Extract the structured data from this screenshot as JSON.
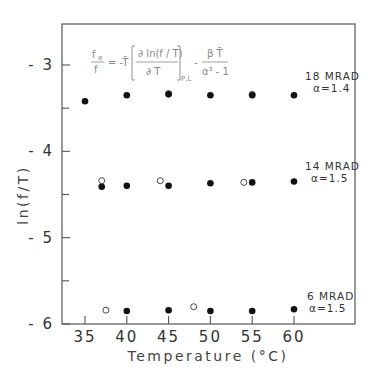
{
  "chart_data": {
    "type": "scatter",
    "title": "",
    "xlabel": "Temperature (°C)",
    "ylabel": "ln(f/T)",
    "xlim": [
      31.5,
      68.5
    ],
    "ylim": [
      -6,
      -2.3
    ],
    "x_ticks": [
      35,
      40,
      45,
      50,
      55,
      60
    ],
    "x_tick_labels": [
      "35",
      "40",
      "45",
      "50",
      "55",
      "60"
    ],
    "y_ticks": [
      -3,
      -4,
      -5,
      -6
    ],
    "y_tick_labels": [
      "-3",
      "-4",
      "-5",
      "-6"
    ],
    "y_minor_ticks": [
      -3.5,
      -4.5,
      -5.5
    ],
    "grid": false,
    "formula": {
      "lhs_num": "f",
      "lhs_num_sub": "e",
      "lhs_den": "f",
      "eq": "= -T̄",
      "frac_num": "∂ ln(f / T)",
      "frac_den": "∂ T",
      "subscript": "P,L",
      "minus": "-",
      "frac2_num": "β T̄",
      "frac2_den": "α³ - 1"
    },
    "series": [
      {
        "name": "18 MRAD",
        "label_line1": "18 MRAD",
        "label_line2": "α=1.4",
        "filled": [
          {
            "x": 35,
            "y": -3.42
          },
          {
            "x": 40,
            "y": -3.35
          },
          {
            "x": 45,
            "y": -3.34
          },
          {
            "x": 50,
            "y": -3.35
          },
          {
            "x": 55,
            "y": -3.35
          },
          {
            "x": 60,
            "y": -3.35
          }
        ],
        "open": [
          {
            "x": 45,
            "y": -3.33
          },
          {
            "x": 55,
            "y": -3.34
          }
        ]
      },
      {
        "name": "14 MRAD",
        "label_line1": "14 MRAD",
        "label_line2": "α=1.5",
        "filled": [
          {
            "x": 37,
            "y": -4.41
          },
          {
            "x": 40,
            "y": -4.4
          },
          {
            "x": 45,
            "y": -4.4
          },
          {
            "x": 50,
            "y": -4.37
          },
          {
            "x": 55,
            "y": -4.36
          },
          {
            "x": 60,
            "y": -4.35
          }
        ],
        "open": [
          {
            "x": 37,
            "y": -4.34
          },
          {
            "x": 44,
            "y": -4.34
          },
          {
            "x": 54,
            "y": -4.36
          }
        ]
      },
      {
        "name": "6 MRAD",
        "label_line1": "6 MRAD",
        "label_line2": "α=1.5",
        "filled": [
          {
            "x": 40,
            "y": -5.85
          },
          {
            "x": 45,
            "y": -5.84
          },
          {
            "x": 50,
            "y": -5.85
          },
          {
            "x": 55,
            "y": -5.85
          },
          {
            "x": 60,
            "y": -5.83
          }
        ],
        "open": [
          {
            "x": 37.5,
            "y": -5.84
          },
          {
            "x": 48,
            "y": -5.8
          }
        ]
      }
    ]
  }
}
